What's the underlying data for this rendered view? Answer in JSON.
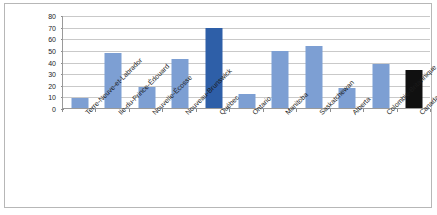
{
  "chart_data": {
    "type": "bar",
    "title": "",
    "subtitle": "",
    "xlabel": "",
    "ylabel": "",
    "ylim": [
      0,
      80
    ],
    "ytick_step": 10,
    "yticks": [
      0,
      10,
      20,
      30,
      40,
      50,
      60,
      70,
      80
    ],
    "grid": true,
    "legend": "none",
    "categories": [
      "Terre-Neuve-et-Labrador",
      "Ile-du-Prince-Édouard",
      "Nouvelle-Écosse",
      "Nouveau-Brunswick",
      "Québec",
      "Ontario",
      "Manitoba",
      "Saskatchewan",
      "Alberta",
      "Colombie-Britannique",
      "Canada"
    ],
    "values": [
      9,
      47,
      18,
      42,
      69,
      12,
      49,
      53,
      17,
      38,
      33
    ],
    "bar_colors": [
      "#7d9fd3",
      "#7d9fd3",
      "#7d9fd3",
      "#7d9fd3",
      "#2e5fa8",
      "#7d9fd3",
      "#7d9fd3",
      "#7d9fd3",
      "#7d9fd3",
      "#7d9fd3",
      "#101010"
    ]
  },
  "style": {
    "plot_background": "#ffffff",
    "frame_border": "#b7b7b7",
    "gridline_color": "#c9c9c9",
    "axis_color": "#9a9a9a",
    "text_color": "#1b1b1b"
  }
}
